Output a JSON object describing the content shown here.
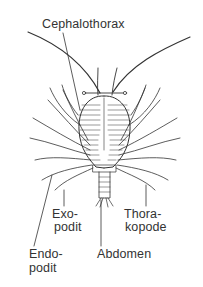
{
  "figure": {
    "labels": {
      "cephalothorax": "Cephalothorax",
      "exopodit_1": "Exo-",
      "exopodit_2": "podit",
      "thorakopode_1": "Thora-",
      "thorakopode_2": "kopode",
      "endopodit_1": "Endo-",
      "endopodit_2": "podit",
      "abdomen": "Abdomen"
    },
    "colors": {
      "ink": "#333333",
      "background": "#ffffff"
    }
  }
}
